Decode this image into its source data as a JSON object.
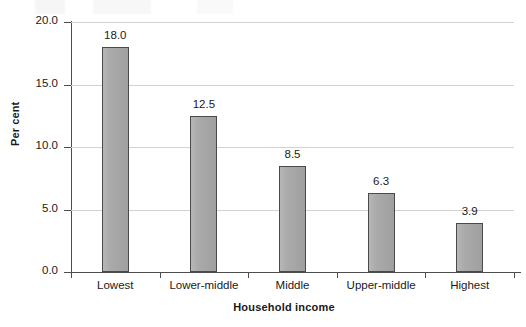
{
  "chart_data": {
    "type": "bar",
    "title": "",
    "xlabel": "Household income",
    "ylabel": "Per cent",
    "categories": [
      "Lowest",
      "Lower-middle",
      "Middle",
      "Upper-middle",
      "Highest"
    ],
    "values": [
      18.0,
      12.5,
      8.5,
      6.3,
      3.9
    ],
    "value_labels": [
      "18.0",
      "12.5",
      "8.5",
      "6.3",
      "3.9"
    ],
    "ylim": [
      0.0,
      20.0
    ],
    "ytick_values": [
      0.0,
      5.0,
      10.0,
      15.0,
      20.0
    ],
    "ytick_labels": [
      "0.0",
      "5.0",
      "10.0",
      "15.0",
      "20.0"
    ],
    "grid": "horizontal",
    "legend": "none",
    "bar_color": "#a9a9a9",
    "bar_edge_color": "#4a4a4a",
    "gridline_color": "#d2d2d2",
    "axis_color": "#4d4d4d",
    "background_color": "#ffffff"
  }
}
